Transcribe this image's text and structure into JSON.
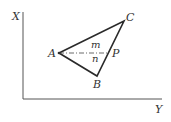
{
  "diagram": {
    "axes": {
      "vertical_label": "X",
      "horizontal_label": "Y"
    },
    "points": {
      "A": {
        "label": "A",
        "x": 59,
        "y": 53
      },
      "B": {
        "label": "B",
        "x": 97,
        "y": 76
      },
      "C": {
        "label": "C",
        "x": 124,
        "y": 21
      },
      "P": {
        "label": "P",
        "x": 109,
        "y": 53
      }
    },
    "regions": {
      "upper": "m",
      "lower": "n"
    },
    "colors": {
      "line": "#2a2a2a",
      "axis": "#555555"
    }
  }
}
